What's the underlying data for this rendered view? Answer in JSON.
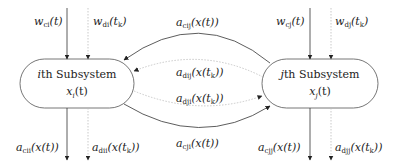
{
  "subsystems": {
    "i": {
      "title_var": "i",
      "title_rest": "th Subsystem",
      "state_base": "x",
      "state_sub": "i",
      "state_arg": "(t)"
    },
    "j": {
      "title_var": "j",
      "title_rest": "th Subsystem",
      "state_base": "x",
      "state_sub": "j",
      "state_arg": "(t)"
    }
  },
  "inputs": {
    "wci": {
      "base": "w",
      "sub": "ci",
      "arg": "(t)",
      "style": "solid"
    },
    "wdi": {
      "base": "w",
      "sub": "di",
      "arg": "(t",
      "arg_sub": "k",
      "arg_end": ")",
      "style": "dotted"
    },
    "wcj": {
      "base": "w",
      "sub": "cj",
      "arg": "(t)",
      "style": "solid"
    },
    "wdj": {
      "base": "w",
      "sub": "dj",
      "arg": "(t",
      "arg_sub": "k",
      "arg_end": ")",
      "style": "dotted"
    }
  },
  "outputs": {
    "acii": {
      "base": "a",
      "sub": "cii",
      "arg": "(x(t))",
      "style": "solid"
    },
    "adii": {
      "base": "a",
      "sub": "dii",
      "arg": "(x(t",
      "arg_sub": "k",
      "arg_end": "))",
      "style": "dotted"
    },
    "acjj": {
      "base": "a",
      "sub": "cjj",
      "arg": "(x(t))",
      "style": "solid"
    },
    "adjj": {
      "base": "a",
      "sub": "djj",
      "arg": "(x(t",
      "arg_sub": "k",
      "arg_end": "))",
      "style": "dotted"
    }
  },
  "couplings": {
    "acij": {
      "base": "a",
      "sub": "cij",
      "arg": "(x(t))",
      "direction": "j-to-i",
      "style": "solid"
    },
    "adij": {
      "base": "a",
      "sub": "dij",
      "arg": "(x(t",
      "arg_sub": "k",
      "arg_end": "))",
      "direction": "j-to-i",
      "style": "dotted"
    },
    "adji": {
      "base": "a",
      "sub": "dji",
      "arg": "(x(t",
      "arg_sub": "k",
      "arg_end": "))",
      "direction": "i-to-j",
      "style": "dotted"
    },
    "acji": {
      "base": "a",
      "sub": "cji",
      "arg": "(x(t))",
      "direction": "i-to-j",
      "style": "solid"
    }
  },
  "colors": {
    "solid_line": "#333333",
    "dotted_line": "#bbbbbb",
    "box_border": "#666666"
  }
}
